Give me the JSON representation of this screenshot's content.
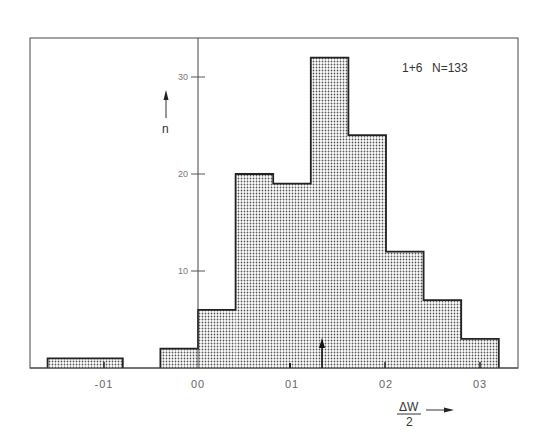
{
  "chart_data": {
    "type": "bar",
    "subtype": "histogram",
    "title": "",
    "legend": {
      "label": "1+6",
      "n_label": "N=133",
      "position": "top-right"
    },
    "xlabel": "ΔW / 2",
    "xlabel_numerator": "ΔW",
    "xlabel_denominator": "2",
    "ylabel": "n",
    "xlim": [
      -0.18,
      0.34
    ],
    "ylim": [
      0,
      34
    ],
    "x_ticks": [
      -0.1,
      0.0,
      0.1,
      0.2,
      0.3
    ],
    "x_tick_labels": [
      "-01",
      "00",
      "01",
      "02",
      "03"
    ],
    "y_ticks": [
      10,
      20,
      30
    ],
    "y_tick_labels": [
      "10",
      "20",
      "30"
    ],
    "grid": false,
    "bin_width": 0.04,
    "bins": [
      {
        "x0": -0.16,
        "x1": -0.12,
        "count": 1
      },
      {
        "x0": -0.12,
        "x1": -0.08,
        "count": 1
      },
      {
        "x0": -0.04,
        "x1": 0.0,
        "count": 2
      },
      {
        "x0": 0.0,
        "x1": 0.04,
        "count": 6
      },
      {
        "x0": 0.04,
        "x1": 0.08,
        "count": 20
      },
      {
        "x0": 0.08,
        "x1": 0.12,
        "count": 19
      },
      {
        "x0": 0.12,
        "x1": 0.16,
        "count": 32
      },
      {
        "x0": 0.16,
        "x1": 0.2,
        "count": 24
      },
      {
        "x0": 0.2,
        "x1": 0.24,
        "count": 12
      },
      {
        "x0": 0.24,
        "x1": 0.28,
        "count": 7
      },
      {
        "x0": 0.28,
        "x1": 0.32,
        "count": 3
      }
    ],
    "categories": [
      "-0.16..-0.12",
      "-0.12..-0.08",
      "-0.04..0.00",
      "0.00..0.04",
      "0.04..0.08",
      "0.08..0.12",
      "0.12..0.16",
      "0.16..0.20",
      "0.20..0.24",
      "0.24..0.28",
      "0.28..0.32"
    ],
    "values": [
      1,
      1,
      2,
      6,
      20,
      19,
      32,
      24,
      12,
      7,
      3
    ],
    "annotations": [
      {
        "type": "arrow-up",
        "x": 0.132,
        "description": "mean marker"
      }
    ],
    "fill_pattern": "dotted"
  },
  "colors": {
    "frame": "#555555",
    "bar_outline": "#222222",
    "bar_fill_dot": "#555555",
    "background": "#ffffff"
  }
}
